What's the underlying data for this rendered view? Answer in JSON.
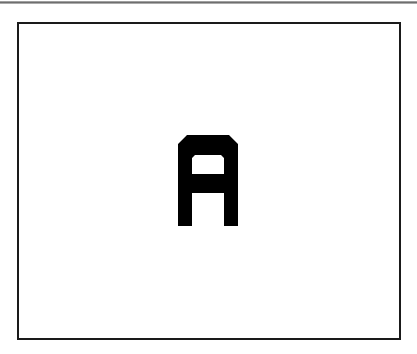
{
  "display": {
    "letter": "A",
    "letter_color": "#000000",
    "frame_color": "#1a1a1a",
    "background": "#ffffff"
  }
}
